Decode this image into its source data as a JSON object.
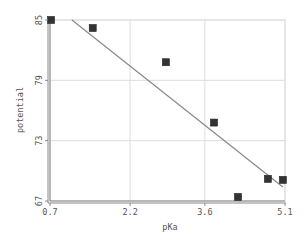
{
  "chart_data": {
    "type": "scatter",
    "title": "",
    "xlabel": "pKa",
    "ylabel": "potential",
    "xlim": [
      0.7,
      5.1
    ],
    "ylim": [
      67,
      85
    ],
    "x_ticks": [
      0.7,
      2.2,
      3.6,
      5.1
    ],
    "x_tick_labels": [
      "0.7",
      "2.2",
      "3.6",
      "5.1"
    ],
    "y_ticks": [
      67,
      73,
      79,
      85
    ],
    "y_tick_labels": [
      "67",
      "73",
      "79",
      "85"
    ],
    "grid": true,
    "legend": null,
    "series": [
      {
        "name": "data",
        "marker": "square",
        "color": "#333333",
        "points": [
          {
            "x": 0.72,
            "y": 85.0
          },
          {
            "x": 1.5,
            "y": 84.2
          },
          {
            "x": 2.87,
            "y": 80.8
          },
          {
            "x": 3.77,
            "y": 74.8
          },
          {
            "x": 4.22,
            "y": 67.4
          },
          {
            "x": 4.78,
            "y": 69.2
          },
          {
            "x": 5.06,
            "y": 69.1
          }
        ]
      }
    ],
    "trendline": {
      "type": "linear",
      "color": "#888888",
      "start": {
        "x": 1.11,
        "y": 85.0
      },
      "end": {
        "x": 5.06,
        "y": 68.4
      }
    }
  },
  "colors": {
    "grid": "#dddddd",
    "axis": "#888888",
    "marker": "#333333",
    "trendline": "#888888",
    "text": "#555555"
  }
}
